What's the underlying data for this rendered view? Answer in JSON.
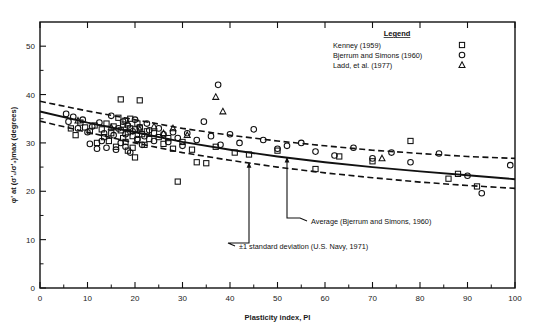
{
  "chart_data": {
    "type": "scatter",
    "title": "",
    "xlabel": "Plasticity index, PI",
    "ylabel": "φ' at (σ'₁/σ'₃)max (degrees)",
    "xlim": [
      0,
      100
    ],
    "ylim": [
      0,
      55
    ],
    "xticks": [
      0,
      10,
      20,
      30,
      40,
      50,
      60,
      70,
      80,
      90,
      100
    ],
    "yticks": [
      0,
      10,
      20,
      30,
      40,
      50
    ],
    "xtick_labels": [
      "0",
      "10",
      "20",
      "30",
      "40",
      "50",
      "60",
      "70",
      "80",
      "90",
      "100"
    ],
    "ytick_labels": [
      "0",
      "10",
      "20",
      "30",
      "40",
      "50"
    ],
    "grid": false,
    "legend_position": "top-right",
    "legend_title": "Legend",
    "series": [
      {
        "name": "Kenney (1959)",
        "marker": "square",
        "points": [
          [
            6.5,
            33.0
          ],
          [
            7.5,
            31.6
          ],
          [
            8.5,
            34.2
          ],
          [
            9.5,
            33.2
          ],
          [
            10.5,
            32.4
          ],
          [
            11.5,
            33.6
          ],
          [
            12.0,
            30.0
          ],
          [
            13.0,
            32.8
          ],
          [
            13.5,
            31.2
          ],
          [
            14.0,
            34.0
          ],
          [
            14.5,
            30.4
          ],
          [
            15.0,
            32.0
          ],
          [
            15.5,
            33.4
          ],
          [
            16.0,
            29.2
          ],
          [
            16.5,
            35.2
          ],
          [
            17.0,
            32.6
          ],
          [
            17.0,
            39.0
          ],
          [
            17.5,
            31.0
          ],
          [
            17.5,
            33.8
          ],
          [
            18.0,
            30.2
          ],
          [
            18.0,
            34.6
          ],
          [
            18.5,
            32.2
          ],
          [
            18.5,
            28.4
          ],
          [
            19.0,
            33.0
          ],
          [
            19.0,
            35.0
          ],
          [
            19.5,
            31.4
          ],
          [
            19.5,
            29.0
          ],
          [
            20.0,
            32.8
          ],
          [
            20.0,
            27.0
          ],
          [
            20.5,
            34.0
          ],
          [
            20.5,
            30.6
          ],
          [
            21.0,
            33.2
          ],
          [
            21.0,
            38.8
          ],
          [
            21.5,
            31.8
          ],
          [
            22.0,
            29.6
          ],
          [
            22.5,
            32.4
          ],
          [
            23.0,
            30.8
          ],
          [
            24.0,
            32.0
          ],
          [
            25.0,
            31.2
          ],
          [
            26.0,
            29.8
          ],
          [
            27.0,
            31.0
          ],
          [
            28.0,
            28.8
          ],
          [
            29.0,
            22.0
          ],
          [
            30.0,
            30.2
          ],
          [
            32.0,
            28.6
          ],
          [
            33.0,
            26.0
          ],
          [
            35.0,
            25.8
          ],
          [
            37.0,
            29.2
          ],
          [
            41.0,
            28.0
          ],
          [
            44.0,
            27.6
          ],
          [
            50.0,
            28.4
          ],
          [
            58.0,
            24.6
          ],
          [
            63.0,
            27.2
          ],
          [
            70.0,
            26.2
          ],
          [
            78.0,
            30.4
          ],
          [
            86.0,
            22.6
          ],
          [
            88.0,
            23.6
          ],
          [
            92.0,
            21.0
          ]
        ]
      },
      {
        "name": "Bjerrum and Simons (1960)",
        "marker": "circle",
        "points": [
          [
            5.5,
            36.0
          ],
          [
            6.0,
            34.4
          ],
          [
            7.0,
            35.4
          ],
          [
            8.0,
            33.0
          ],
          [
            9.0,
            34.8
          ],
          [
            10.0,
            32.2
          ],
          [
            10.5,
            29.8
          ],
          [
            11.0,
            33.4
          ],
          [
            12.0,
            28.8
          ],
          [
            12.5,
            34.2
          ],
          [
            13.0,
            30.4
          ],
          [
            13.5,
            32.0
          ],
          [
            14.0,
            29.0
          ],
          [
            15.0,
            35.6
          ],
          [
            15.5,
            31.6
          ],
          [
            16.0,
            28.6
          ],
          [
            16.5,
            33.0
          ],
          [
            17.0,
            30.0
          ],
          [
            17.5,
            34.4
          ],
          [
            18.0,
            31.8
          ],
          [
            18.0,
            29.2
          ],
          [
            18.5,
            33.6
          ],
          [
            19.0,
            28.0
          ],
          [
            19.5,
            32.4
          ],
          [
            20.0,
            34.8
          ],
          [
            20.5,
            30.8
          ],
          [
            21.0,
            33.2
          ],
          [
            21.5,
            29.6
          ],
          [
            22.0,
            31.4
          ],
          [
            22.5,
            34.0
          ],
          [
            23.0,
            32.6
          ],
          [
            24.0,
            30.4
          ],
          [
            25.0,
            33.0
          ],
          [
            26.0,
            31.8
          ],
          [
            27.0,
            30.2
          ],
          [
            28.0,
            32.2
          ],
          [
            29.0,
            31.0
          ],
          [
            30.0,
            29.4
          ],
          [
            31.0,
            32.0
          ],
          [
            33.0,
            30.6
          ],
          [
            34.5,
            34.4
          ],
          [
            36.0,
            31.4
          ],
          [
            37.5,
            42.0
          ],
          [
            38.0,
            29.6
          ],
          [
            40.0,
            31.8
          ],
          [
            42.0,
            30.0
          ],
          [
            45.0,
            32.8
          ],
          [
            47.0,
            30.6
          ],
          [
            50.0,
            28.8
          ],
          [
            52.0,
            29.4
          ],
          [
            55.0,
            30.0
          ],
          [
            58.0,
            28.2
          ],
          [
            62.0,
            27.4
          ],
          [
            66.0,
            29.0
          ],
          [
            70.0,
            26.8
          ],
          [
            74.0,
            28.0
          ],
          [
            78.0,
            26.0
          ],
          [
            84.0,
            27.8
          ],
          [
            90.0,
            23.2
          ],
          [
            93.0,
            19.6
          ],
          [
            99.0,
            25.4
          ]
        ]
      },
      {
        "name": "Ladd, et al. (1977)",
        "marker": "triangle",
        "points": [
          [
            8.0,
            34.6
          ],
          [
            15.0,
            33.2
          ],
          [
            18.5,
            34.0
          ],
          [
            21.0,
            32.8
          ],
          [
            24.0,
            33.4
          ],
          [
            26.0,
            32.0
          ],
          [
            28.0,
            33.0
          ],
          [
            31.0,
            31.6
          ],
          [
            37.0,
            39.5
          ],
          [
            38.5,
            36.5
          ],
          [
            72.0,
            26.8
          ]
        ]
      }
    ],
    "curves": [
      {
        "name": "Average (Bjerrum and Simons, 1960)",
        "style": "solid",
        "points": [
          [
            0,
            36.5
          ],
          [
            10,
            34.2
          ],
          [
            20,
            32.2
          ],
          [
            30,
            30.2
          ],
          [
            40,
            28.6
          ],
          [
            50,
            27.2
          ],
          [
            60,
            26.0
          ],
          [
            70,
            25.0
          ],
          [
            80,
            24.1
          ],
          [
            90,
            23.3
          ],
          [
            100,
            22.5
          ]
        ]
      },
      {
        "name": "+1 standard deviation (U.S. Navy, 1971)",
        "style": "dashed",
        "points": [
          [
            0,
            38.6
          ],
          [
            10,
            36.6
          ],
          [
            20,
            34.8
          ],
          [
            30,
            33.0
          ],
          [
            40,
            31.6
          ],
          [
            50,
            30.4
          ],
          [
            60,
            29.4
          ],
          [
            70,
            28.5
          ],
          [
            80,
            27.8
          ],
          [
            90,
            27.2
          ],
          [
            100,
            26.8
          ]
        ]
      },
      {
        "name": "-1 standard deviation (U.S. Navy, 1971)",
        "style": "dashed",
        "points": [
          [
            0,
            34.5
          ],
          [
            10,
            32.2
          ],
          [
            20,
            30.0
          ],
          [
            30,
            28.0
          ],
          [
            40,
            26.4
          ],
          [
            50,
            25.0
          ],
          [
            60,
            23.8
          ],
          [
            70,
            22.8
          ],
          [
            80,
            21.9
          ],
          [
            90,
            21.2
          ],
          [
            100,
            20.6
          ]
        ]
      }
    ],
    "annotations": [
      {
        "text": "Average (Bjerrum and Simons, 1960)",
        "target_x": 52.0,
        "target_y": 26.9
      },
      {
        "text": "±1 standard deviation (U.S. Navy, 1971)",
        "target_x": 44.0,
        "target_y": 25.8
      }
    ]
  },
  "legend": {
    "title": "Legend",
    "items": [
      {
        "label": "Kenney (1959)",
        "marker": "square"
      },
      {
        "label": "Bjerrum and Simons (1960)",
        "marker": "circle"
      },
      {
        "label": "Ladd, et al. (1977)",
        "marker": "triangle"
      }
    ]
  },
  "axes": {
    "x_title": "Plasticity index, PI",
    "y_title": "φ' at (σ'₁/σ'₃)max (degrees)"
  },
  "colors": {
    "ink": "#111111",
    "background": "#ffffff"
  }
}
